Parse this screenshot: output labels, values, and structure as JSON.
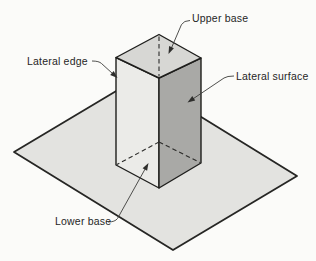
{
  "figure": {
    "kind": "geometry-diagram",
    "labels": {
      "upper_base": "Upper base",
      "lateral_edge": "Lateral edge",
      "lateral_surface": "Lateral surface",
      "lower_base": "Lower base"
    },
    "colors": {
      "background": "#fbfbf9",
      "plane_fill": "#e3e3e0",
      "prism_left_face": "#ebebe8",
      "prism_top_face": "#d7d7d4",
      "prism_right_face": "#a9a9a6",
      "edge_stroke": "#1e1e1c",
      "plane_stroke": "#262624",
      "leader_stroke": "#3c3c3a",
      "label_color": "#262626"
    }
  }
}
